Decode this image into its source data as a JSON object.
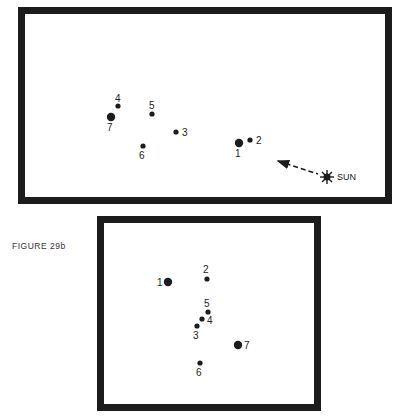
{
  "caption": "FIGURE 29b",
  "top_panel": {
    "points": [
      {
        "id": "1",
        "x": 239,
        "y": 143,
        "r": 4.2,
        "label": "1",
        "lx": 235,
        "ly": 149
      },
      {
        "id": "2",
        "x": 250,
        "y": 140,
        "r": 2.6,
        "label": "2",
        "lx": 256,
        "ly": 136
      },
      {
        "id": "3",
        "x": 176,
        "y": 132,
        "r": 2.6,
        "label": "3",
        "lx": 182,
        "ly": 128
      },
      {
        "id": "4",
        "x": 118,
        "y": 106,
        "r": 2.6,
        "label": "4",
        "lx": 115,
        "ly": 94
      },
      {
        "id": "5",
        "x": 152,
        "y": 114,
        "r": 2.6,
        "label": "5",
        "lx": 149,
        "ly": 101
      },
      {
        "id": "6",
        "x": 143,
        "y": 146,
        "r": 2.6,
        "label": "6",
        "lx": 139,
        "ly": 151
      },
      {
        "id": "7",
        "x": 111,
        "y": 117,
        "r": 4.2,
        "label": "7",
        "lx": 107,
        "ly": 123
      }
    ],
    "sun": {
      "x": 327,
      "y": 177,
      "label": "SUN",
      "lx": 337,
      "ly": 172
    },
    "arrow": {
      "x1": 318,
      "y1": 174,
      "x2": 278,
      "y2": 161
    }
  },
  "bottom_panel": {
    "points": [
      {
        "id": "1",
        "x": 168,
        "y": 282,
        "r": 4.2,
        "label": "1",
        "lx": 157,
        "ly": 278
      },
      {
        "id": "2",
        "x": 207,
        "y": 279,
        "r": 2.6,
        "label": "2",
        "lx": 203,
        "ly": 265
      },
      {
        "id": "3",
        "x": 197,
        "y": 326,
        "r": 2.6,
        "label": "3",
        "lx": 193,
        "ly": 331
      },
      {
        "id": "4",
        "x": 202,
        "y": 319,
        "r": 2.6,
        "label": "4",
        "lx": 207,
        "ly": 316
      },
      {
        "id": "5",
        "x": 208,
        "y": 312,
        "r": 2.6,
        "label": "5",
        "lx": 204,
        "ly": 299
      },
      {
        "id": "6",
        "x": 200,
        "y": 363,
        "r": 2.6,
        "label": "6",
        "lx": 196,
        "ly": 368
      },
      {
        "id": "7",
        "x": 238,
        "y": 345,
        "r": 4.2,
        "label": "7",
        "lx": 244,
        "ly": 341
      }
    ]
  }
}
